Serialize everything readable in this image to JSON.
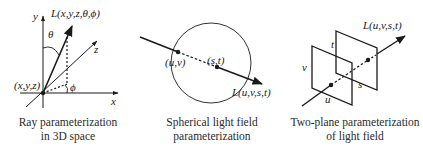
{
  "panels": [
    {
      "id": "ray-3d",
      "labels": {
        "y_axis": "y",
        "x_axis": "x",
        "z_axis": "z",
        "origin": "(x,y,z)",
        "ray": "L(x,y,z,θ,ϕ)",
        "theta": "θ",
        "phi": "ϕ"
      },
      "caption": [
        "Ray parameterization",
        "in 3D space"
      ]
    },
    {
      "id": "spherical",
      "labels": {
        "entry_point": "(u,v)",
        "exit_point": "(s,t)",
        "ray": "L(u,v,s,t)"
      },
      "caption": [
        "Spherical light field",
        "parameterization"
      ]
    },
    {
      "id": "two-plane",
      "labels": {
        "ray": "L(u,v,s,t)",
        "u": "u",
        "v": "v",
        "s": "s",
        "t": "t"
      },
      "caption": [
        "Two-plane parameterization",
        "of light field"
      ]
    }
  ],
  "colors": {
    "stroke": "#1a1a1a",
    "background": "#ffffff"
  }
}
